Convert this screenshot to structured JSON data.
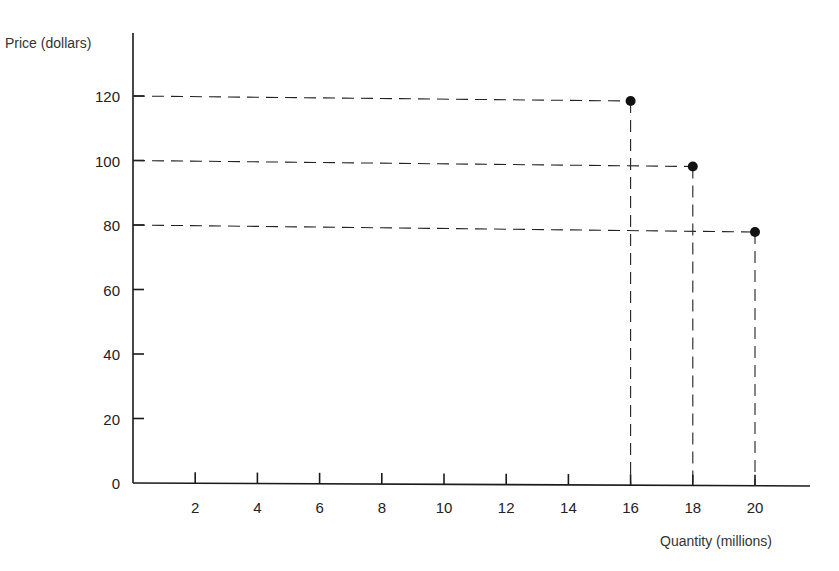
{
  "chart_data": {
    "type": "scatter",
    "title": "",
    "xlabel": "Quantity (millions)",
    "ylabel": "Price (dollars)",
    "x_ticks": [
      "2",
      "4",
      "6",
      "8",
      "10",
      "12",
      "14",
      "16",
      "18",
      "20"
    ],
    "y_ticks": [
      "0",
      "20",
      "40",
      "60",
      "80",
      "100",
      "120"
    ],
    "xlim": [
      0,
      22
    ],
    "ylim": [
      0,
      140
    ],
    "grid": false,
    "legend": null,
    "series": [
      {
        "name": "price-quantity points",
        "points": [
          {
            "x": 16,
            "y": 120
          },
          {
            "x": 18,
            "y": 100
          },
          {
            "x": 20,
            "y": 80
          }
        ]
      }
    ],
    "annotations": [
      "Dashed reference lines from each point to both axes"
    ],
    "colors": {
      "ink": "#1a1a1a",
      "background": "#ffffff"
    }
  }
}
